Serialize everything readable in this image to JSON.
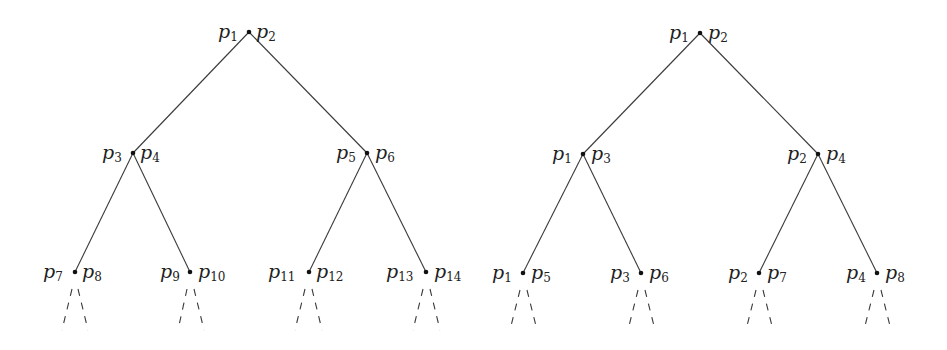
{
  "diagram": {
    "type": "binary-tree-pair",
    "trees": [
      {
        "name": "left-tree",
        "nodes": [
          {
            "id": "root",
            "left_label": "p",
            "left_sub": "1",
            "right_label": "p",
            "right_sub": "2"
          },
          {
            "id": "l",
            "left_label": "p",
            "left_sub": "3",
            "right_label": "p",
            "right_sub": "4"
          },
          {
            "id": "r",
            "left_label": "p",
            "left_sub": "5",
            "right_label": "p",
            "right_sub": "6"
          },
          {
            "id": "ll",
            "left_label": "p",
            "left_sub": "7",
            "right_label": "p",
            "right_sub": "8"
          },
          {
            "id": "lr",
            "left_label": "p",
            "left_sub": "9",
            "right_label": "p",
            "right_sub": "10"
          },
          {
            "id": "rl",
            "left_label": "p",
            "left_sub": "11",
            "right_label": "p",
            "right_sub": "12"
          },
          {
            "id": "rr",
            "left_label": "p",
            "left_sub": "13",
            "right_label": "p",
            "right_sub": "14"
          }
        ]
      },
      {
        "name": "right-tree",
        "nodes": [
          {
            "id": "root",
            "left_label": "p",
            "left_sub": "1",
            "right_label": "p",
            "right_sub": "2"
          },
          {
            "id": "l",
            "left_label": "p",
            "left_sub": "1",
            "right_label": "p",
            "right_sub": "3"
          },
          {
            "id": "r",
            "left_label": "p",
            "left_sub": "2",
            "right_label": "p",
            "right_sub": "4"
          },
          {
            "id": "ll",
            "left_label": "p",
            "left_sub": "1",
            "right_label": "p",
            "right_sub": "5"
          },
          {
            "id": "lr",
            "left_label": "p",
            "left_sub": "3",
            "right_label": "p",
            "right_sub": "6"
          },
          {
            "id": "rl",
            "left_label": "p",
            "left_sub": "2",
            "right_label": "p",
            "right_sub": "7"
          },
          {
            "id": "rr",
            "left_label": "p",
            "left_sub": "4",
            "right_label": "p",
            "right_sub": "8"
          }
        ]
      }
    ]
  }
}
